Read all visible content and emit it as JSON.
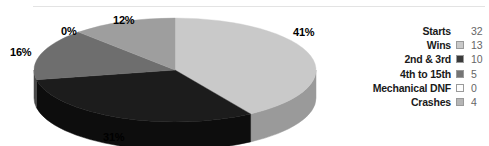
{
  "chart_data": {
    "type": "pie",
    "title": "",
    "subtitle": "",
    "xlabel": "",
    "ylabel": "",
    "grid": false,
    "legend_position": "right",
    "three_d": true,
    "start_angle_deg": 0,
    "direction": "clockwise",
    "categories": [
      "Wins",
      "2nd & 3rd",
      "4th to 15th",
      "Mechanical DNF",
      "Crashes"
    ],
    "values": [
      13,
      10,
      5,
      0,
      4
    ],
    "percent_labels": [
      "41%",
      "31%",
      "16%",
      "0%",
      "12%"
    ],
    "percents": [
      41,
      31,
      16,
      0,
      12
    ],
    "colors": [
      "#c9c9c9",
      "#1c1c1c",
      "#6e6e6e",
      "#f2f2f2",
      "#9e9e9e"
    ],
    "total": 32,
    "total_label": "Starts"
  },
  "pie": {
    "slices": [
      {
        "name": "Wins",
        "percent_label": "41%",
        "percent": 41,
        "value": 13,
        "color": "#c9c9c9",
        "side_color": "#9a9a9a"
      },
      {
        "name": "2nd & 3rd",
        "percent_label": "31%",
        "percent": 31,
        "value": 10,
        "color": "#1c1c1c",
        "side_color": "#0d0d0d"
      },
      {
        "name": "4th to 15th",
        "percent_label": "16%",
        "percent": 16,
        "value": 5,
        "color": "#6e6e6e",
        "side_color": "#4a4a4a"
      },
      {
        "name": "Mechanical DNF",
        "percent_label": "0%",
        "percent": 0,
        "value": 0,
        "color": "#f2f2f2",
        "side_color": "#cccccc"
      },
      {
        "name": "Crashes",
        "percent_label": "12%",
        "percent": 12,
        "value": 4,
        "color": "#9e9e9e",
        "side_color": "#777777"
      }
    ]
  },
  "legend": {
    "rows": [
      {
        "label": "Starts",
        "value": "32",
        "swatch": "none",
        "swatch_color": ""
      },
      {
        "label": "Wins",
        "value": "13",
        "swatch": "square",
        "swatch_color": "#c9c9c9"
      },
      {
        "label": "2nd & 3rd",
        "value": "10",
        "swatch": "square",
        "swatch_color": "#3a3a3a"
      },
      {
        "label": "4th to 15th",
        "value": "5",
        "swatch": "square",
        "swatch_color": "#757575"
      },
      {
        "label": "Mechanical DNF",
        "value": "0",
        "swatch": "square",
        "swatch_color": "#fdfdfd"
      },
      {
        "label": "Crashes",
        "value": "4",
        "swatch": "square",
        "swatch_color": "#b5b5b5"
      }
    ]
  },
  "theme": {
    "background": "#ffffff",
    "text_color": "#1a1a1a",
    "value_color": "#666666",
    "rule_color": "#e3e3e3"
  }
}
